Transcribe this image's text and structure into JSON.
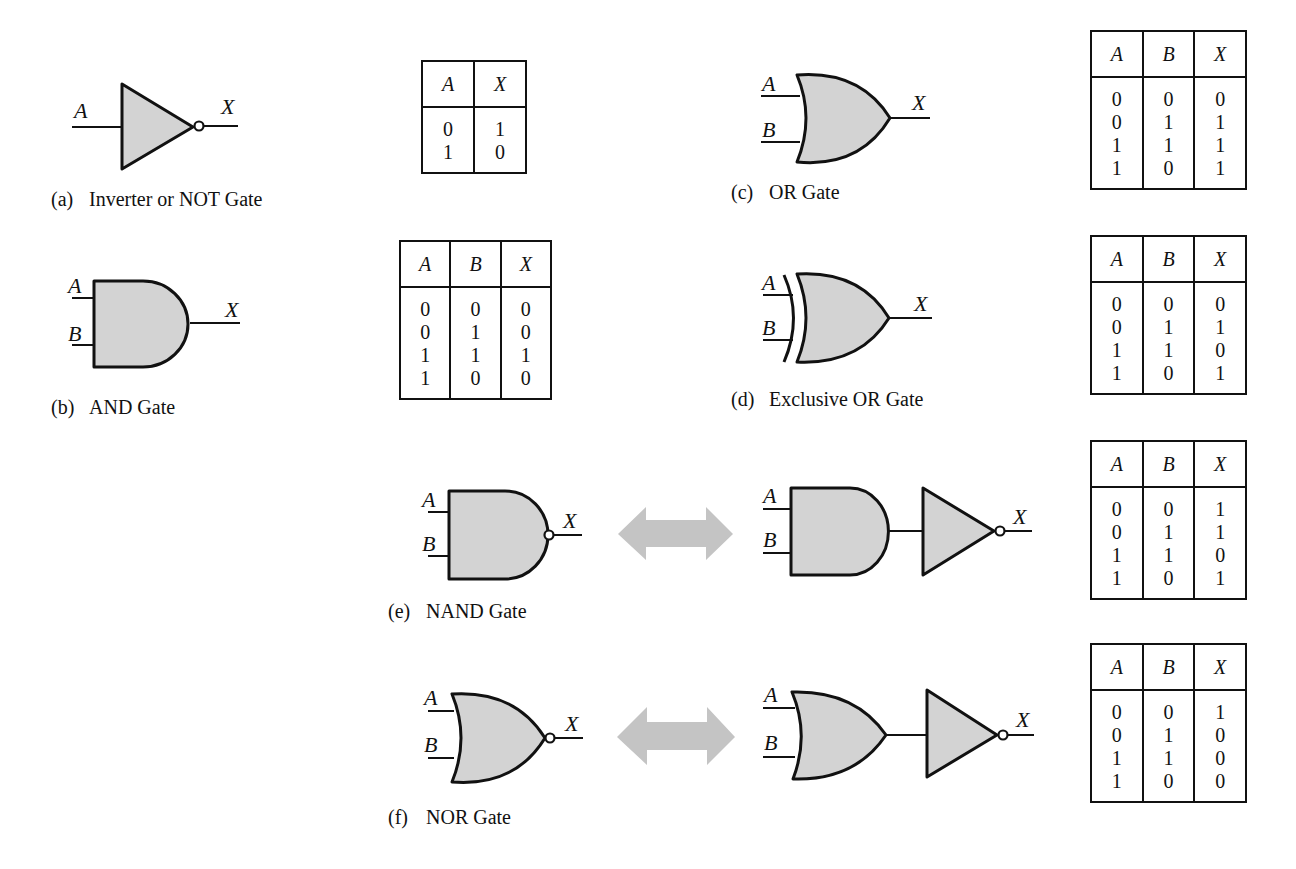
{
  "figure": {
    "gates": [
      {
        "id": "a",
        "tag": "(a)",
        "caption": "Inverter or NOT Gate",
        "inputs": [
          "A"
        ],
        "output": "X"
      },
      {
        "id": "b",
        "tag": "(b)",
        "caption": "AND Gate",
        "inputs": [
          "A",
          "B"
        ],
        "output": "X"
      },
      {
        "id": "c",
        "tag": "(c)",
        "caption": "OR Gate",
        "inputs": [
          "A",
          "B"
        ],
        "output": "X"
      },
      {
        "id": "d",
        "tag": "(d)",
        "caption": "Exclusive OR Gate",
        "inputs": [
          "A",
          "B"
        ],
        "output": "X"
      },
      {
        "id": "e",
        "tag": "(e)",
        "caption": "NAND Gate",
        "inputs": [
          "A",
          "B"
        ],
        "output": "X",
        "equivalent": "AND followed by inverter"
      },
      {
        "id": "f",
        "tag": "(f)",
        "caption": "NOR Gate",
        "inputs": [
          "A",
          "B"
        ],
        "output": "X",
        "equivalent": "OR followed by inverter"
      }
    ],
    "truth_tables": {
      "not": {
        "headers": [
          "A",
          "X"
        ],
        "rows": [
          [
            "0",
            "1"
          ],
          [
            "1",
            "0"
          ]
        ]
      },
      "and": {
        "headers": [
          "A",
          "B",
          "X"
        ],
        "rows": [
          [
            "0",
            "0",
            "0"
          ],
          [
            "0",
            "1",
            "0"
          ],
          [
            "1",
            "1",
            "1"
          ],
          [
            "1",
            "0",
            "0"
          ]
        ]
      },
      "or": {
        "headers": [
          "A",
          "B",
          "X"
        ],
        "rows": [
          [
            "0",
            "0",
            "0"
          ],
          [
            "0",
            "1",
            "1"
          ],
          [
            "1",
            "1",
            "1"
          ],
          [
            "1",
            "0",
            "1"
          ]
        ]
      },
      "xor": {
        "headers": [
          "A",
          "B",
          "X"
        ],
        "rows": [
          [
            "0",
            "0",
            "0"
          ],
          [
            "0",
            "1",
            "1"
          ],
          [
            "1",
            "1",
            "0"
          ],
          [
            "1",
            "0",
            "1"
          ]
        ]
      },
      "nand": {
        "headers": [
          "A",
          "B",
          "X"
        ],
        "rows": [
          [
            "0",
            "0",
            "1"
          ],
          [
            "0",
            "1",
            "1"
          ],
          [
            "1",
            "1",
            "0"
          ],
          [
            "1",
            "0",
            "1"
          ]
        ]
      },
      "nor": {
        "headers": [
          "A",
          "B",
          "X"
        ],
        "rows": [
          [
            "0",
            "0",
            "1"
          ],
          [
            "0",
            "1",
            "0"
          ],
          [
            "1",
            "1",
            "0"
          ],
          [
            "1",
            "0",
            "0"
          ]
        ]
      }
    },
    "labels": {
      "a": "A",
      "b": "B",
      "x": "X"
    },
    "colors": {
      "gate_fill": "#d3d3d3",
      "stroke": "#111111",
      "arrow": "#c4c4c4"
    }
  }
}
